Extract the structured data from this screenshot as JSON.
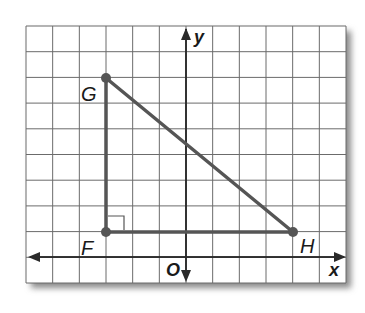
{
  "diagram": {
    "type": "coordinate-plane-triangle",
    "grid": {
      "x_min": -6,
      "x_max": 6,
      "y_min": -1,
      "y_max": 9,
      "grid_color": "#6b6b6b",
      "background": "#ffffff"
    },
    "axes": {
      "x_label": "x",
      "y_label": "y",
      "origin_label": "O"
    },
    "points": [
      {
        "name": "G",
        "x": -3,
        "y": 7
      },
      {
        "name": "F",
        "x": -3,
        "y": 1
      },
      {
        "name": "H",
        "x": 4,
        "y": 1
      }
    ],
    "segments": [
      {
        "from": "G",
        "to": "F"
      },
      {
        "from": "F",
        "to": "H"
      },
      {
        "from": "G",
        "to": "H"
      }
    ],
    "right_angle_at": "F",
    "line_color": "#555555"
  }
}
